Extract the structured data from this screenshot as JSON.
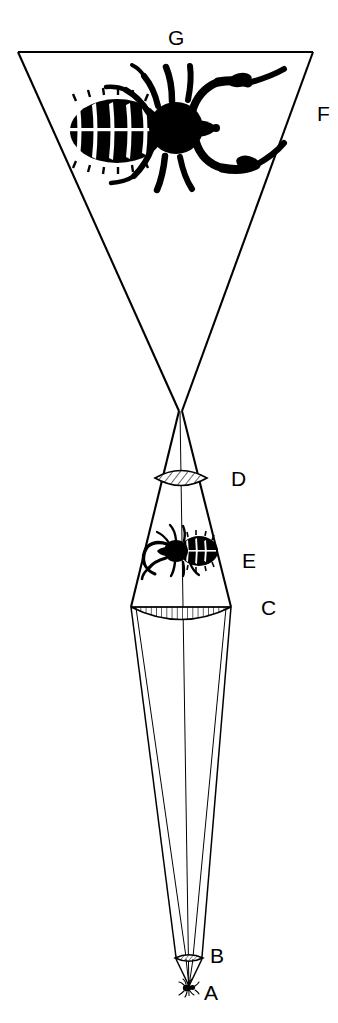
{
  "figure": {
    "background_color": "#ffffff",
    "ink_color": "#000000",
    "width": 338,
    "height": 1023
  },
  "labels": [
    {
      "id": "G",
      "text": "G",
      "x": 168,
      "y": 45,
      "meaning": "final enlarged virtual image of the specimen"
    },
    {
      "id": "F",
      "text": "F",
      "x": 317,
      "y": 121,
      "meaning": "apparent cone of rays forming the virtual image"
    },
    {
      "id": "D",
      "text": "D",
      "x": 231,
      "y": 486,
      "meaning": "eye lens of the eyepiece"
    },
    {
      "id": "E",
      "text": "E",
      "x": 242,
      "y": 568,
      "meaning": "real inverted intermediate image"
    },
    {
      "id": "C",
      "text": "C",
      "x": 261,
      "y": 615,
      "meaning": "field lens of the eyepiece"
    },
    {
      "id": "B",
      "text": "B",
      "x": 210,
      "y": 963,
      "meaning": "objective lens"
    },
    {
      "id": "A",
      "text": "A",
      "x": 204,
      "y": 1000,
      "meaning": "specimen object"
    }
  ],
  "elements": {
    "virtual_image_outline": {
      "name": "inverted-triangle-F-G",
      "top_left_x": 18,
      "top_right_x": 313,
      "top_y": 52,
      "apex_x": 180,
      "apex_y": 410
    },
    "eye_node": {
      "name": "ray-crossing-point",
      "x": 180,
      "y": 410
    },
    "eye_lens": {
      "name": "eye-lens-D",
      "type": "biconvex",
      "center_x": 181,
      "center_y": 478,
      "half_width": 26,
      "bulge": 12,
      "hatching": "diagonal"
    },
    "field_lens": {
      "name": "field-lens-C",
      "type": "plano-convex",
      "center_x": 181,
      "center_y": 607,
      "half_width": 50,
      "bulge": 20,
      "hatching": "vertical"
    },
    "objective_lens": {
      "name": "objective-lens-B",
      "type": "biconvex",
      "center_x": 189,
      "center_y": 958,
      "half_width": 14,
      "bulge": 5,
      "hatching": "diagonal"
    },
    "specimen": {
      "name": "specimen-A",
      "center_x": 189,
      "center_y": 987,
      "size": 14
    },
    "intermediate_image": {
      "name": "intermediate-image-E",
      "center_x": 182,
      "center_y": 552,
      "width": 78,
      "height": 58
    },
    "magnified_image": {
      "name": "magnified-image-G",
      "center_x": 170,
      "center_y": 130,
      "width": 215,
      "height": 150
    },
    "optical_axis": {
      "name": "optical-axis",
      "x_top": 180,
      "y_top": 410,
      "x_bottom": 189,
      "y_bottom": 995
    }
  },
  "optics_data": {
    "type": "ray-diagram",
    "stages": [
      {
        "order": 1,
        "label": "A",
        "role": "object",
        "description": "Small insect specimen placed just below the objective lens"
      },
      {
        "order": 2,
        "label": "B",
        "role": "objective-lens",
        "description": "Objective lens collecting light from the specimen"
      },
      {
        "order": 3,
        "label": "C",
        "role": "field-lens",
        "description": "Field lens of the eyepiece, plano-convex with vertical hatching"
      },
      {
        "order": 4,
        "label": "E",
        "role": "real-image",
        "description": "Real inverted intermediate image formed between the field lens and eye lens"
      },
      {
        "order": 5,
        "label": "D",
        "role": "eye-lens",
        "description": "Eye lens of the eyepiece, biconvex with diagonal hatching"
      },
      {
        "order": 6,
        "label": "F",
        "role": "virtual-ray-cone",
        "description": "Diverging cone of rays that appear to come from the enlarged image"
      },
      {
        "order": 7,
        "label": "G",
        "role": "virtual-image",
        "description": "Greatly enlarged final virtual image seen by the observer"
      }
    ]
  }
}
